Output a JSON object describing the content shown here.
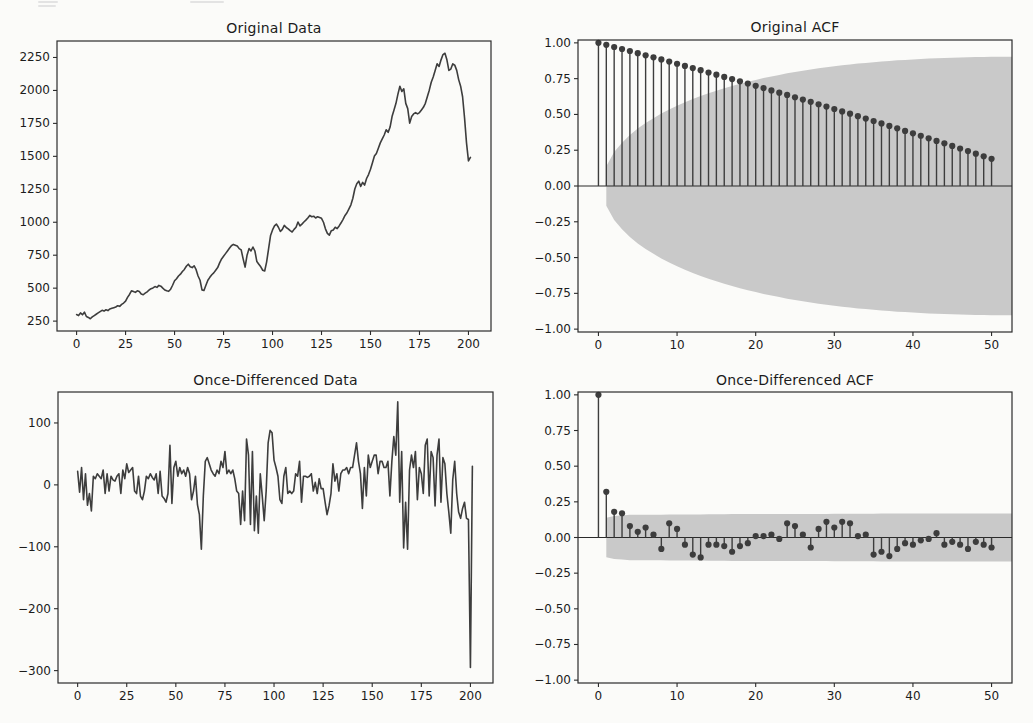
{
  "figure": {
    "background": "#fbfbf9",
    "ink_color": "#3d3d3d",
    "band_color": "#c9c9c9",
    "spine_color": "#2b2b2b",
    "text_color": "#1c1c1c"
  },
  "chart_data": [
    {
      "id": "original-data",
      "type": "line",
      "title": "Original Data",
      "xlabel": "",
      "ylabel": "",
      "frame": {
        "left": 57,
        "top": 41,
        "right": 491,
        "bottom": 331
      },
      "xlim": [
        -10,
        211.5
      ],
      "ylim": [
        175,
        2375
      ],
      "grid": false,
      "xticks": [
        0,
        25,
        50,
        75,
        100,
        125,
        150,
        175,
        200
      ],
      "xtick_labels": [
        "0",
        "25",
        "50",
        "75",
        "100",
        "125",
        "150",
        "175",
        "200"
      ],
      "yticks": [
        250,
        500,
        750,
        1000,
        1250,
        1500,
        1750,
        2000,
        2250
      ],
      "ytick_labels": [
        "250",
        "500",
        "750",
        "1000",
        "1250",
        "1500",
        "1750",
        "2000",
        "2250"
      ],
      "x_start": 0,
      "values": [
        300,
        292,
        312,
        298,
        318,
        285,
        278,
        268,
        282,
        292,
        302,
        312,
        322,
        332,
        326,
        336,
        330,
        342,
        347,
        352,
        357,
        367,
        362,
        377,
        387,
        402,
        430,
        452,
        480,
        474,
        468,
        480,
        474,
        455,
        450,
        462,
        472,
        486,
        496,
        502,
        512,
        506,
        521,
        515,
        500,
        486,
        480,
        476,
        492,
        522,
        556,
        572,
        592,
        606,
        626,
        642,
        666,
        682,
        662,
        656,
        670,
        640,
        592,
        560,
        487,
        482,
        522,
        560,
        582,
        602,
        616,
        636,
        656,
        692,
        722,
        742,
        762,
        782,
        802,
        822,
        832,
        826,
        820,
        800,
        790,
        722,
        660,
        750,
        800,
        782,
        812,
        782,
        702,
        682,
        662,
        636,
        630,
        700,
        800,
        900,
        942,
        972,
        986,
        962,
        930,
        946,
        976,
        960,
        950,
        936,
        926,
        946,
        962,
        1002,
        972,
        986,
        1002,
        1016,
        1032,
        1052,
        1042,
        1046,
        1032,
        1042,
        1036,
        1030,
        1000,
        950,
        916,
        902,
        936,
        942,
        962,
        952,
        972,
        996,
        1022,
        1052,
        1072,
        1102,
        1132,
        1182,
        1252,
        1292,
        1312,
        1272,
        1302,
        1282,
        1332,
        1362,
        1402,
        1452,
        1502,
        1522,
        1562,
        1602,
        1632,
        1662,
        1702,
        1682,
        1722,
        1802,
        1852,
        1902,
        1972,
        2032,
        1992,
        2012,
        1902,
        1862,
        1752,
        1802,
        1822,
        1832,
        1822,
        1832,
        1852,
        1872,
        1902,
        1952,
        2002,
        2062,
        2102,
        2152,
        2202,
        2182,
        2232,
        2272,
        2282,
        2232,
        2152,
        2162,
        2202,
        2192,
        2152,
        2082,
        2032,
        1952,
        1792,
        1602,
        1465,
        1492
      ]
    },
    {
      "id": "original-acf",
      "type": "stem",
      "title": "Original ACF",
      "xlabel": "",
      "ylabel": "",
      "frame": {
        "left": 578,
        "top": 40,
        "right": 1012,
        "bottom": 332
      },
      "xlim": [
        -2.6,
        52.6
      ],
      "ylim": [
        -1.02,
        1.02
      ],
      "grid": false,
      "zero_line": true,
      "xticks": [
        0,
        10,
        20,
        30,
        40,
        50
      ],
      "xtick_labels": [
        "0",
        "10",
        "20",
        "30",
        "40",
        "50"
      ],
      "yticks": [
        1.0,
        0.75,
        0.5,
        0.25,
        0.0,
        -0.25,
        -0.5,
        -0.75,
        -1.0
      ],
      "ytick_labels": [
        "1.00",
        "0.75",
        "0.50",
        "0.25",
        "0.00",
        "−0.25",
        "−0.50",
        "−0.75",
        "−1.00"
      ],
      "lags": "0-50",
      "values": [
        1.0,
        0.986,
        0.971,
        0.957,
        0.943,
        0.928,
        0.913,
        0.899,
        0.884,
        0.869,
        0.854,
        0.839,
        0.824,
        0.809,
        0.793,
        0.778,
        0.762,
        0.747,
        0.731,
        0.716,
        0.7,
        0.684,
        0.668,
        0.652,
        0.636,
        0.62,
        0.604,
        0.588,
        0.571,
        0.555,
        0.538,
        0.521,
        0.505,
        0.488,
        0.471,
        0.454,
        0.437,
        0.42,
        0.403,
        0.385,
        0.368,
        0.351,
        0.333,
        0.315,
        0.298,
        0.28,
        0.262,
        0.244,
        0.226,
        0.208,
        0.19
      ],
      "band": {
        "start_lag": 1,
        "half_widths": [
          0.138,
          0.237,
          0.303,
          0.356,
          0.401,
          0.44,
          0.474,
          0.506,
          0.534,
          0.56,
          0.585,
          0.607,
          0.628,
          0.648,
          0.666,
          0.683,
          0.699,
          0.714,
          0.728,
          0.741,
          0.754,
          0.765,
          0.776,
          0.787,
          0.796,
          0.806,
          0.814,
          0.822,
          0.83,
          0.837,
          0.843,
          0.849,
          0.855,
          0.86,
          0.865,
          0.87,
          0.874,
          0.878,
          0.881,
          0.884,
          0.887,
          0.89,
          0.892,
          0.894,
          0.896,
          0.898,
          0.899,
          0.901,
          0.902,
          0.903
        ],
        "extend_to": 52.6
      }
    },
    {
      "id": "once-differenced-data",
      "type": "line",
      "title": "Once-Differenced Data",
      "xlabel": "",
      "ylabel": "",
      "frame": {
        "left": 58,
        "top": 392,
        "right": 493,
        "bottom": 683
      },
      "xlim": [
        -10,
        211.5
      ],
      "ylim": [
        -320,
        150
      ],
      "grid": false,
      "xticks": [
        0,
        25,
        50,
        75,
        100,
        125,
        150,
        175,
        200
      ],
      "xtick_labels": [
        "0",
        "25",
        "50",
        "75",
        "100",
        "125",
        "150",
        "175",
        "200"
      ],
      "yticks": [
        100,
        0,
        -100,
        -200,
        -300
      ],
      "ytick_labels": [
        "100",
        "0",
        "−100",
        "−200",
        "−300"
      ],
      "x_start": 0,
      "values": [
        22,
        -12,
        28,
        -24,
        18,
        -33,
        -14,
        -42,
        14,
        10,
        18,
        14,
        10,
        24,
        -14,
        18,
        -10,
        14,
        8,
        6,
        14,
        18,
        -14,
        24,
        10,
        34,
        20,
        24,
        28,
        -10,
        -14,
        14,
        -18,
        -24,
        -10,
        14,
        10,
        18,
        12,
        8,
        18,
        -14,
        22,
        -18,
        -22,
        -28,
        -14,
        64,
        -30,
        28,
        38,
        14,
        28,
        18,
        24,
        14,
        28,
        18,
        -24,
        -10,
        14,
        -32,
        -48,
        -104,
        -18,
        38,
        44,
        34,
        24,
        18,
        14,
        24,
        18,
        38,
        28,
        54,
        18,
        24,
        18,
        24,
        10,
        -10,
        -14,
        -64,
        -10,
        -58,
        74,
        48,
        -64,
        54,
        -74,
        -18,
        -78,
        18,
        -18,
        -58,
        -10,
        68,
        88,
        84,
        40,
        28,
        14,
        -24,
        -30,
        14,
        28,
        -14,
        -10,
        -14,
        -10,
        18,
        14,
        38,
        -28,
        14,
        14,
        12,
        14,
        18,
        -10,
        4,
        -14,
        10,
        -6,
        -6,
        -28,
        -48,
        -34,
        -14,
        34,
        6,
        18,
        -10,
        18,
        24,
        24,
        28,
        18,
        28,
        28,
        48,
        68,
        38,
        18,
        -38,
        28,
        -18,
        48,
        28,
        38,
        48,
        48,
        18,
        38,
        38,
        28,
        28,
        38,
        -18,
        38,
        78,
        48,
        134,
        -28,
        54,
        -102,
        -28,
        -104,
        24,
        48,
        28,
        54,
        -24,
        28,
        18,
        -14,
        64,
        74,
        -18,
        54,
        44,
        -34,
        48,
        74,
        -28,
        44,
        34,
        -14,
        -44,
        -78,
        8,
        38,
        -14,
        -44,
        -54,
        -38,
        -28,
        -54,
        -56,
        -295,
        30
      ]
    },
    {
      "id": "once-differenced-acf",
      "type": "stem",
      "title": "Once-Differenced ACF",
      "xlabel": "",
      "ylabel": "",
      "frame": {
        "left": 578,
        "top": 392,
        "right": 1012,
        "bottom": 683
      },
      "xlim": [
        -2.6,
        52.6
      ],
      "ylim": [
        -1.02,
        1.02
      ],
      "grid": false,
      "zero_line": true,
      "xticks": [
        0,
        10,
        20,
        30,
        40,
        50
      ],
      "xtick_labels": [
        "0",
        "10",
        "20",
        "30",
        "40",
        "50"
      ],
      "yticks": [
        1.0,
        0.75,
        0.5,
        0.25,
        0.0,
        -0.25,
        -0.5,
        -0.75,
        -1.0
      ],
      "ytick_labels": [
        "1.00",
        "0.75",
        "0.50",
        "0.25",
        "0.00",
        "−0.25",
        "−0.50",
        "−0.75",
        "−1.00"
      ],
      "lags": "0-50",
      "values": [
        1.0,
        0.32,
        0.18,
        0.17,
        0.08,
        0.04,
        0.07,
        0.02,
        -0.08,
        0.1,
        0.06,
        -0.05,
        -0.12,
        -0.14,
        -0.05,
        -0.05,
        -0.06,
        -0.1,
        -0.06,
        -0.04,
        0.01,
        0.01,
        0.02,
        -0.01,
        0.1,
        0.08,
        0.02,
        -0.07,
        0.06,
        0.11,
        0.07,
        0.11,
        0.1,
        0.01,
        0.02,
        -0.12,
        -0.1,
        -0.13,
        -0.08,
        -0.04,
        -0.05,
        -0.02,
        -0.01,
        0.03,
        -0.05,
        -0.03,
        -0.05,
        -0.08,
        -0.03,
        -0.05,
        -0.07
      ],
      "band": {
        "start_lag": 1,
        "half_widths": [
          0.138,
          0.151,
          0.155,
          0.159,
          0.159,
          0.16,
          0.16,
          0.16,
          0.161,
          0.161,
          0.161,
          0.162,
          0.162,
          0.163,
          0.163,
          0.163,
          0.164,
          0.164,
          0.164,
          0.164,
          0.164,
          0.164,
          0.164,
          0.164,
          0.165,
          0.165,
          0.165,
          0.165,
          0.165,
          0.166,
          0.166,
          0.166,
          0.167,
          0.167,
          0.167,
          0.168,
          0.168,
          0.168,
          0.168,
          0.168,
          0.168,
          0.168,
          0.168,
          0.168,
          0.168,
          0.168,
          0.169,
          0.169,
          0.169,
          0.169
        ],
        "extend_to": 52.6
      }
    }
  ]
}
